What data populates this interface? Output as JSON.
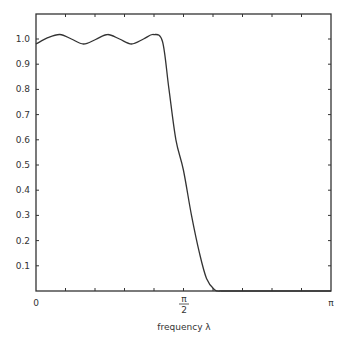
{
  "chart_data": {
    "type": "line",
    "title": "",
    "xlabel": "frequency λ",
    "ylabel": "",
    "xlim": [
      0,
      3.14159
    ],
    "ylim": [
      0,
      1.1
    ],
    "grid": false,
    "legend": null,
    "x_tick_labels": [
      {
        "value": 0,
        "label": "0"
      },
      {
        "value": 1.5708,
        "label": "π/2"
      },
      {
        "value": 3.14159,
        "label": "π"
      }
    ],
    "y_tick_labels": [
      "0.1",
      "0.2",
      "0.3",
      "0.4",
      "0.5",
      "0.6",
      "0.7",
      "0.8",
      "0.9",
      "1.0"
    ],
    "y_ticks": [
      0.1,
      0.2,
      0.3,
      0.4,
      0.5,
      0.6,
      0.7,
      0.8,
      0.9,
      1.0
    ],
    "x_ticks_count": 10,
    "series": [
      {
        "name": "frequency response",
        "x": [
          0,
          0.126,
          0.254,
          0.377,
          0.505,
          0.635,
          0.762,
          0.889,
          1.017,
          1.145,
          1.251,
          1.347,
          1.416,
          1.49,
          1.57,
          1.656,
          1.741,
          1.816,
          1.901,
          1.97
        ],
        "y": [
          0.98,
          1.005,
          1.018,
          1.0,
          0.98,
          0.998,
          1.018,
          1.0,
          0.98,
          1.0,
          1.018,
          0.99,
          0.8,
          0.6,
          0.48,
          0.3,
          0.15,
          0.05,
          0.005,
          0.0
        ]
      }
    ]
  },
  "axis": {
    "x_label_zero": "0",
    "x_label_half_pi_num": "π",
    "x_label_half_pi_den": "2",
    "x_label_pi": "π",
    "x_title": "frequency  λ"
  }
}
